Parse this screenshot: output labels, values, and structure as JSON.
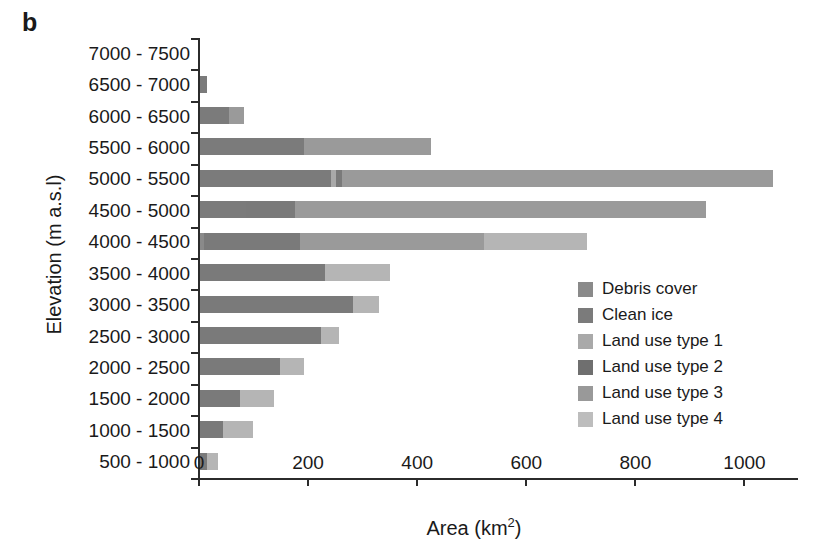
{
  "figure": {
    "panel_letter": "b",
    "xlabel_main": "Area (km",
    "xlabel_sup": "2",
    "xlabel_close": ")",
    "ylabel": "Elevation (m a.s.l)"
  },
  "chart_data": {
    "type": "bar",
    "orientation": "horizontal",
    "stacked": true,
    "title": "b",
    "xlabel": "Area (km2)",
    "ylabel": "Elevation (m a.s.l)",
    "xlim": [
      0,
      1100
    ],
    "xticks": [
      0,
      200,
      400,
      600,
      800,
      1000
    ],
    "xtick_labels": [
      "0",
      "200",
      "400",
      "600",
      "800",
      "1000"
    ],
    "grid": false,
    "legend_position": "center-right",
    "categories": [
      "7000 - 7500",
      "6500 - 7000",
      "6000 - 6500",
      "5500 - 6000",
      "5000 - 5500",
      "4500 - 5000",
      "4000 - 4500",
      "3500 - 4000",
      "3000 - 3500",
      "2500 - 3000",
      "2000 - 2500",
      "1500 - 2000",
      "1000 - 1500",
      "500 - 1000"
    ],
    "series": [
      {
        "name": "Debris cover",
        "color": "#8a8a8a",
        "values": [
          0,
          0,
          0,
          0,
          0,
          0,
          8,
          0,
          0,
          0,
          0,
          0,
          0,
          0
        ]
      },
      {
        "name": "Clean ice",
        "color": "#7b7b7b",
        "values": [
          0,
          13,
          53,
          190,
          240,
          85,
          0,
          0,
          0,
          0,
          0,
          0,
          0,
          0
        ]
      },
      {
        "name": "Land use type 1",
        "color": "#a9a9a9",
        "values": [
          0,
          0,
          0,
          0,
          10,
          0,
          0,
          0,
          0,
          0,
          0,
          0,
          0,
          0
        ]
      },
      {
        "name": "Land use type 2",
        "color": "#7a7a7a",
        "values": [
          0,
          0,
          0,
          0,
          10,
          90,
          175,
          230,
          281,
          221,
          146,
          74,
          43,
          13
        ]
      },
      {
        "name": "Land use type 3",
        "color": "#9a9a9a",
        "values": [
          0,
          0,
          27,
          234,
          791,
          753,
          338,
          0,
          0,
          0,
          0,
          0,
          0,
          0
        ]
      },
      {
        "name": "Land use type 4",
        "color": "#b5b5b5",
        "values": [
          0,
          0,
          0,
          0,
          0,
          0,
          189,
          118,
          47,
          33,
          44,
          62,
          55,
          20
        ]
      }
    ],
    "totals": [
      0,
      13,
      80,
      424,
      1051,
      928,
      710,
      348,
      328,
      254,
      190,
      136,
      98,
      33
    ]
  },
  "legend": {
    "items": [
      {
        "label": "Debris cover",
        "color": "#8a8a8a"
      },
      {
        "label": "Clean ice",
        "color": "#7b7b7b"
      },
      {
        "label": "Land use type 1",
        "color": "#a9a9a9"
      },
      {
        "label": "Land use type 2",
        "color": "#6f6f6f"
      },
      {
        "label": "Land use type 3",
        "color": "#999999"
      },
      {
        "label": "Land use type 4",
        "color": "#bdbdbd"
      }
    ]
  },
  "colors": {
    "axis": "#2b2b2b",
    "background": "#ffffff",
    "text": "#1a1a1a"
  }
}
